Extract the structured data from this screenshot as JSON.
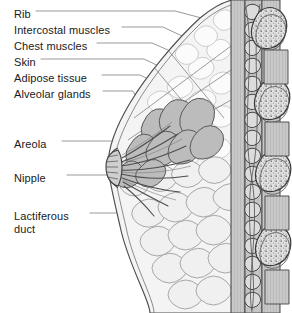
{
  "figure": {
    "background_color": "#ffffff",
    "line_color": "#4d4d4d",
    "leader_color": "#8c8c8c",
    "text_color": "#1a1a1a"
  },
  "labels": [
    {
      "id": "rib",
      "text": "Rib",
      "x": 14,
      "y": 14,
      "leader": true
    },
    {
      "id": "intercostal",
      "text": "Intercostal muscles",
      "x": 14,
      "y": 30,
      "leader": true
    },
    {
      "id": "chest-muscles",
      "text": "Chest muscles",
      "x": 14,
      "y": 46,
      "leader": true
    },
    {
      "id": "skin",
      "text": "Skin",
      "x": 14,
      "y": 62,
      "leader": true
    },
    {
      "id": "adipose",
      "text": "Adipose tissue",
      "x": 14,
      "y": 78,
      "leader": true
    },
    {
      "id": "alveolar",
      "text": "Alveolar glands",
      "x": 14,
      "y": 94,
      "leader": true
    },
    {
      "id": "areola",
      "text": "Areola",
      "x": 14,
      "y": 144,
      "leader": true
    },
    {
      "id": "nipple",
      "text": "Nipple",
      "x": 14,
      "y": 178,
      "leader": true
    },
    {
      "id": "lactiferous-duct",
      "text": "Lactiferous",
      "x": 14,
      "y": 216,
      "leader": true
    },
    {
      "id": "lactiferous-duct2",
      "text": "duct",
      "x": 14,
      "y": 229,
      "leader": false
    }
  ],
  "structures": {
    "rib_count": 4,
    "gland_lobe_count": 9,
    "duct_count": 8,
    "colors": {
      "bone_fill": "#d9d9d9",
      "muscle_fill": "#c9c9c9",
      "gland_fill": "#b9b9b9",
      "adipose_fill": "#f2f2f2",
      "skin_fill": "#e8e8e8",
      "nipple_fill": "#cfcfcf"
    }
  }
}
